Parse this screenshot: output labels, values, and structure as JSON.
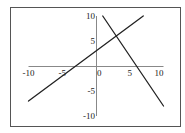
{
  "chart_data": {
    "type": "line",
    "title": "",
    "xlabel": "",
    "ylabel": "",
    "xlim": [
      -10,
      10
    ],
    "ylim": [
      -10,
      10
    ],
    "grid": false,
    "legend": null,
    "x_ticks": [
      {
        "value": -10,
        "label": "-10"
      },
      {
        "value": -5,
        "label": "-5"
      },
      {
        "value": 0,
        "label": "0"
      },
      {
        "value": 5,
        "label": "5"
      },
      {
        "value": 10,
        "label": "10"
      }
    ],
    "y_ticks": [
      {
        "value": 10,
        "label": "10"
      },
      {
        "value": 5,
        "label": "5"
      },
      {
        "value": -5,
        "label": "-5"
      },
      {
        "value": -10,
        "label": "-10"
      }
    ],
    "series": [
      {
        "name": "line-1",
        "equation": "y = x + 3",
        "points": [
          [
            -10,
            -7
          ],
          [
            7,
            10
          ]
        ]
      },
      {
        "name": "line-2",
        "equation": "y = -2x + 12",
        "points": [
          [
            1,
            10
          ],
          [
            10,
            -8
          ]
        ]
      }
    ],
    "intersection": [
      3,
      6
    ]
  },
  "colors": {
    "frame": "#555555",
    "axis": "#888888",
    "line": "#222222",
    "text": "#222222"
  }
}
